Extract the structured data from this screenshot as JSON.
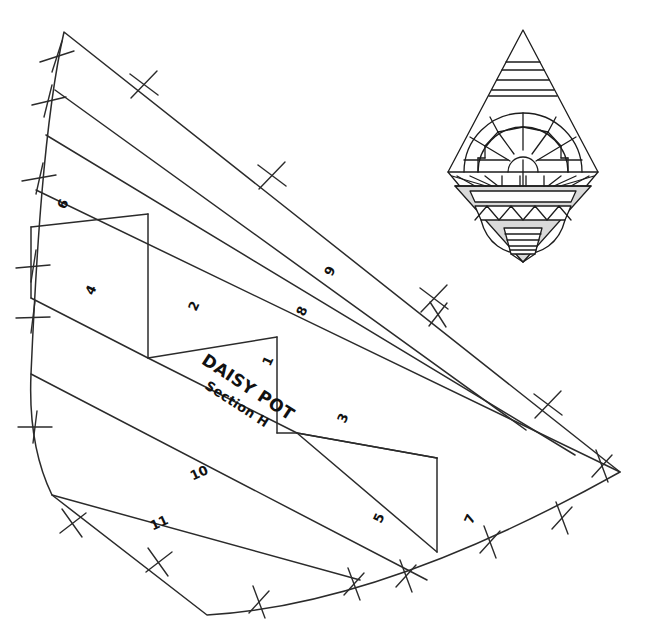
{
  "document": {
    "type": "quilt-pattern-template",
    "title": "DAISY POT",
    "subtitle": "Section H",
    "background_color": "#ffffff",
    "line_color": "#2b2b2b",
    "pot_fill_color": "#d9d9d9"
  },
  "pattern": {
    "name": "fan-wedge-template",
    "piece_numbers": [
      {
        "id": "1",
        "label": "1",
        "x": 272,
        "y": 363,
        "rotation": -65
      },
      {
        "id": "2",
        "label": "2",
        "x": 198,
        "y": 308,
        "rotation": -65
      },
      {
        "id": "3",
        "label": "3",
        "x": 347,
        "y": 420,
        "rotation": -65
      },
      {
        "id": "4",
        "label": "4",
        "x": 95,
        "y": 292,
        "rotation": -65
      },
      {
        "id": "5",
        "label": "5",
        "x": 383,
        "y": 520,
        "rotation": -65
      },
      {
        "id": "6",
        "label": "6",
        "x": 67,
        "y": 206,
        "rotation": -65
      },
      {
        "id": "7",
        "label": "7",
        "x": 474,
        "y": 521,
        "rotation": -65
      },
      {
        "id": "8",
        "label": "8",
        "x": 306,
        "y": 313,
        "rotation": -65
      },
      {
        "id": "9",
        "label": "9",
        "x": 334,
        "y": 273,
        "rotation": -65
      },
      {
        "id": "10",
        "label": "10",
        "x": 201,
        "y": 477,
        "rotation": -25
      },
      {
        "id": "11",
        "label": "11",
        "x": 161,
        "y": 527,
        "rotation": -25
      }
    ],
    "label_block": {
      "title": "DAISY POT",
      "subtitle": "Section H",
      "x": 245,
      "y": 395,
      "rotation": 33
    }
  },
  "emblem": {
    "name": "daisy-pot-block-preview",
    "description": "diamond shaped pieced block with fan daisy above a striped pot",
    "center_x": 523,
    "top_y": 30,
    "bottom_y": 262,
    "half_width": 75,
    "waist_y": 172,
    "pot_color": "#d9d9d9"
  }
}
